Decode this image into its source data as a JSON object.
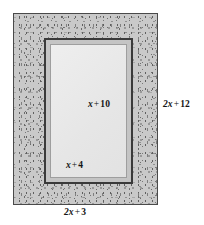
{
  "figure": {
    "type": "geometry-diagram",
    "colors": {
      "frame_fill": "#c9c9c9",
      "frame_speckle": "#6d6d6d",
      "frame_border": "#4a4a4a",
      "inner_outline": "#3a3a3a",
      "inner_mat": "#c4c4c4",
      "inner_field": "#e8e8e8",
      "text": "#141414"
    },
    "labels": {
      "inner_height": {
        "var": "x",
        "op": "+",
        "num": "10",
        "full": "x + 10"
      },
      "inner_width": {
        "var": "x",
        "op": "+",
        "num": "4",
        "full": "x + 4"
      },
      "outer_height": {
        "var": "2x",
        "op": "+",
        "num": "12",
        "full": "2x + 12"
      },
      "outer_width": {
        "var": "2x",
        "op": "+",
        "num": "3",
        "full": "2x + 3"
      }
    }
  }
}
